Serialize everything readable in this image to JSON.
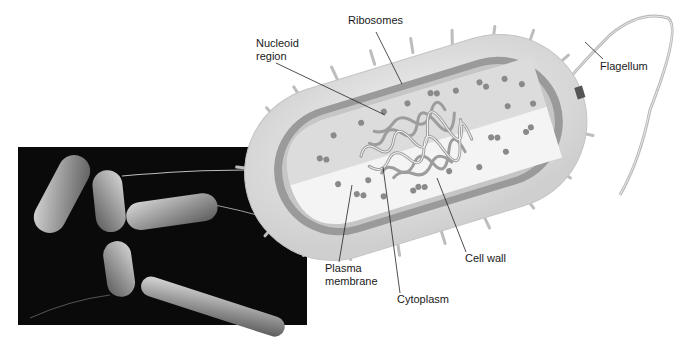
{
  "figure": {
    "micrograph": {
      "description": "Scanning electron micrograph of rod-shaped bacteria"
    },
    "labels": {
      "ribosomes": "Ribosomes",
      "nucleoid_line1": "Nucleoid",
      "nucleoid_line2": "region",
      "flagellum": "Flagellum",
      "plasma_line1": "Plasma",
      "plasma_line2": "membrane",
      "cytoplasm": "Cytoplasm",
      "cell_wall": "Cell wall"
    },
    "colors": {
      "background": "#ffffff",
      "cell_outer": "#e2e2e2",
      "cell_wall_band": "#9a9a9a",
      "cytoplasm": "#ececec",
      "ribosome": "#8a8a8a",
      "micrograph_bg": "#0a0a0a",
      "leader_line": "#222222"
    }
  }
}
